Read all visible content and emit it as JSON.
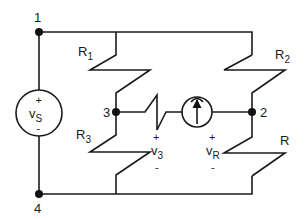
{
  "diagram": {
    "type": "circuit-schematic",
    "colors": {
      "line": "#1a1a1a",
      "node": "#111111",
      "background": "#ffffff"
    },
    "nodes": [
      {
        "id": "1",
        "label": "1",
        "x": 39,
        "y": 32
      },
      {
        "id": "2",
        "label": "2",
        "x": 252,
        "y": 112
      },
      {
        "id": "3",
        "label": "3",
        "x": 116,
        "y": 112
      },
      {
        "id": "4",
        "label": "4",
        "x": 39,
        "y": 194
      }
    ],
    "components": {
      "vs": {
        "name": "v",
        "sub": "S",
        "plus": "+",
        "minus": "-",
        "kind": "independent voltage source"
      },
      "r1": {
        "name": "R",
        "sub": "1"
      },
      "r2": {
        "name": "R",
        "sub": "2"
      },
      "r3": {
        "name": "R",
        "sub": "3"
      },
      "r": {
        "name": "R"
      },
      "v3": {
        "name": "v",
        "sub": "3",
        "plus": "+",
        "minus": "-"
      },
      "vr": {
        "name": "v",
        "sub": "R",
        "plus": "+",
        "minus": "-"
      },
      "is": {
        "kind": "current source",
        "direction": "up"
      }
    }
  }
}
